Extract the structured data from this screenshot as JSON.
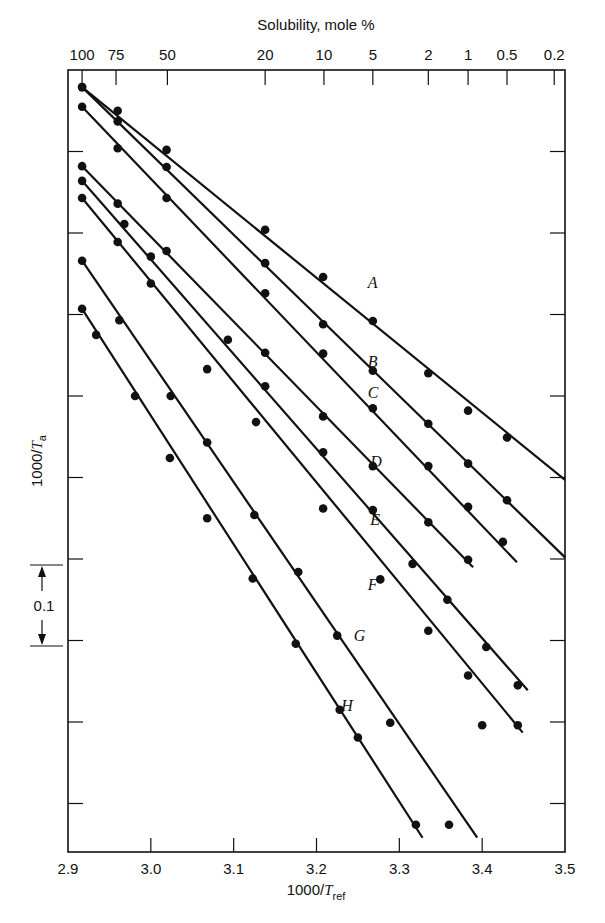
{
  "chart_data": {
    "type": "scatter",
    "title": "",
    "xlabel": "1000/T_ref",
    "ylabel": "1000/T_a",
    "top_axis_label": "Solubility, mole %",
    "xlim": [
      2.9,
      3.5
    ],
    "ylim": [
      -0.96,
      0.0
    ],
    "y_note": "y values are relative offsets of 1000/T_a from the top of the axis; the axis has no numeric labels, only a 0.1 scale bar",
    "grid": false,
    "x_ticks": [
      2.9,
      3.0,
      3.1,
      3.2,
      3.3,
      3.4,
      3.5
    ],
    "x_tick_labels": [
      "2.9",
      "3.0",
      "3.1",
      "3.2",
      "3.3",
      "3.4",
      "3.5"
    ],
    "top_ticks": [
      {
        "label": "100",
        "x": 2.917
      },
      {
        "label": "75",
        "x": 2.958
      },
      {
        "label": "50",
        "x": 3.02
      },
      {
        "label": "20",
        "x": 3.138
      },
      {
        "label": "10",
        "x": 3.209
      },
      {
        "label": "5",
        "x": 3.268
      },
      {
        "label": "2",
        "x": 3.335
      },
      {
        "label": "1",
        "x": 3.383
      },
      {
        "label": "0.5",
        "x": 3.43
      },
      {
        "label": "0.2",
        "x": 3.487
      }
    ],
    "y_tick_step": 0.1,
    "scale_bar": {
      "label": "0.1",
      "from": -0.607,
      "to": -0.707
    },
    "series": [
      {
        "name": "A",
        "line": [
          [
            2.917,
            -0.021
          ],
          [
            3.5,
            -0.503
          ]
        ],
        "label_pos": [
          3.262,
          -0.268
        ],
        "points": [
          [
            2.917,
            -0.021
          ],
          [
            2.96,
            -0.05
          ],
          [
            3.019,
            -0.098
          ],
          [
            3.138,
            -0.196
          ],
          [
            3.208,
            -0.254
          ],
          [
            3.268,
            -0.308
          ],
          [
            3.335,
            -0.372
          ],
          [
            3.383,
            -0.418
          ],
          [
            3.43,
            -0.451
          ]
        ]
      },
      {
        "name": "B",
        "line": [
          [
            2.917,
            -0.021
          ],
          [
            3.5,
            -0.598
          ]
        ],
        "label_pos": [
          3.262,
          -0.364
        ],
        "points": [
          [
            2.917,
            -0.021
          ],
          [
            2.96,
            -0.063
          ],
          [
            3.019,
            -0.119
          ],
          [
            3.138,
            -0.237
          ],
          [
            3.208,
            -0.312
          ],
          [
            3.268,
            -0.369
          ],
          [
            3.335,
            -0.434
          ],
          [
            3.383,
            -0.483
          ],
          [
            3.43,
            -0.528
          ]
        ]
      },
      {
        "name": "C",
        "line": [
          [
            2.917,
            -0.045
          ],
          [
            3.442,
            -0.604
          ]
        ],
        "label_pos": [
          3.262,
          -0.403
        ],
        "points": [
          [
            2.917,
            -0.045
          ],
          [
            2.96,
            -0.096
          ],
          [
            3.019,
            -0.157
          ],
          [
            3.138,
            -0.274
          ],
          [
            3.208,
            -0.348
          ],
          [
            3.268,
            -0.415
          ],
          [
            3.335,
            -0.486
          ],
          [
            3.383,
            -0.536
          ],
          [
            3.425,
            -0.579
          ]
        ]
      },
      {
        "name": "D",
        "line": [
          [
            2.917,
            -0.118
          ],
          [
            3.389,
            -0.61
          ]
        ],
        "label_pos": [
          3.265,
          -0.487
        ],
        "points": [
          [
            2.917,
            -0.118
          ],
          [
            2.96,
            -0.164
          ],
          [
            3.019,
            -0.222
          ],
          [
            3.093,
            -0.331
          ],
          [
            3.138,
            -0.347
          ],
          [
            3.208,
            -0.425
          ],
          [
            3.268,
            -0.486
          ],
          [
            3.335,
            -0.555
          ],
          [
            3.383,
            -0.601
          ]
        ]
      },
      {
        "name": "E",
        "line": [
          [
            2.917,
            -0.136
          ],
          [
            3.455,
            -0.761
          ]
        ],
        "label_pos": [
          3.265,
          -0.558
        ],
        "points": [
          [
            2.917,
            -0.136
          ],
          [
            2.968,
            -0.189
          ],
          [
            3.0,
            -0.229
          ],
          [
            3.138,
            -0.388
          ],
          [
            3.208,
            -0.469
          ],
          [
            3.268,
            -0.54
          ],
          [
            3.316,
            -0.606
          ],
          [
            3.358,
            -0.65
          ],
          [
            3.405,
            -0.708
          ],
          [
            3.443,
            -0.755
          ]
        ]
      },
      {
        "name": "F",
        "line": [
          [
            2.917,
            -0.157
          ],
          [
            3.449,
            -0.813
          ]
        ],
        "label_pos": [
          3.262,
          -0.638
        ],
        "points": [
          [
            2.917,
            -0.157
          ],
          [
            2.96,
            -0.211
          ],
          [
            3.0,
            -0.262
          ],
          [
            3.068,
            -0.367
          ],
          [
            3.127,
            -0.432
          ],
          [
            3.208,
            -0.538
          ],
          [
            3.277,
            -0.625
          ],
          [
            3.335,
            -0.688
          ],
          [
            3.383,
            -0.743
          ],
          [
            3.4,
            -0.804
          ],
          [
            3.443,
            -0.804
          ]
        ]
      },
      {
        "name": "G",
        "line": [
          [
            2.917,
            -0.234
          ],
          [
            3.394,
            -0.942
          ]
        ],
        "label_pos": [
          3.245,
          -0.7
        ],
        "points": [
          [
            2.917,
            -0.234
          ],
          [
            2.962,
            -0.307
          ],
          [
            3.024,
            -0.4
          ],
          [
            3.068,
            -0.457
          ],
          [
            3.125,
            -0.546
          ],
          [
            3.178,
            -0.616
          ],
          [
            3.225,
            -0.694
          ],
          [
            3.289,
            -0.801
          ],
          [
            3.36,
            -0.926
          ]
        ]
      },
      {
        "name": "H",
        "line": [
          [
            2.917,
            -0.293
          ],
          [
            3.328,
            -0.942
          ]
        ],
        "label_pos": [
          3.23,
          -0.787
        ],
        "points": [
          [
            2.917,
            -0.293
          ],
          [
            2.934,
            -0.325
          ],
          [
            2.981,
            -0.4
          ],
          [
            3.023,
            -0.476
          ],
          [
            3.068,
            -0.55
          ],
          [
            3.123,
            -0.624
          ],
          [
            3.175,
            -0.704
          ],
          [
            3.228,
            -0.785
          ],
          [
            3.25,
            -0.819
          ],
          [
            3.32,
            -0.926
          ]
        ]
      }
    ]
  },
  "labels": {
    "top_axis_title": "Solubility, mole %",
    "x_axis_title_main": "1000/",
    "x_axis_title_var": "T",
    "x_axis_title_sub": "ref",
    "y_axis_title_main": "1000/",
    "y_axis_title_var": "T",
    "y_axis_title_sub": "a",
    "scale_bar_label": "0.1"
  }
}
